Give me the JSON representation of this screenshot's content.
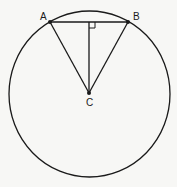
{
  "diagram": {
    "type": "circle-geometry",
    "circle": {
      "cx": 89.5,
      "cy": 94,
      "rx": 80.5,
      "ry": 83
    },
    "points": {
      "A": {
        "label": "A",
        "x": 50,
        "y": 22,
        "label_x": 40,
        "label_y": 20
      },
      "B": {
        "label": "B",
        "x": 128,
        "y": 22,
        "label_x": 133,
        "label_y": 20
      },
      "C": {
        "label": "C",
        "x": 89,
        "y": 93,
        "label_x": 86,
        "label_y": 106
      }
    },
    "segments": [
      "AB",
      "AC",
      "BC",
      "C-to-midpoint-AB"
    ],
    "right_angle_marker": {
      "x": 89,
      "y": 22,
      "size": 6
    },
    "colors": {
      "stroke": "#1a1a1a",
      "background": "#f7f7f5"
    }
  }
}
